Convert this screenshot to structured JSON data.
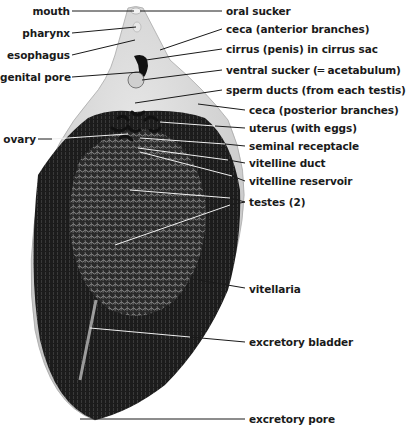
{
  "figure": {
    "colors": {
      "background": "#ffffff",
      "body_light": "#d4d4d4",
      "body_mid": "#8a8a8a",
      "vitellaria_dark": "#1c1c1c",
      "testes": "#5a5a5a",
      "leader_lines": "#1a1a1a",
      "inner_leader_lines": "#f0f0f0"
    }
  },
  "labels": {
    "left": [
      {
        "text": "mouth",
        "x": 60,
        "y": 5
      },
      {
        "text": "pharynx",
        "x": 68,
        "y": 27
      },
      {
        "text": "esophagus",
        "x": 68,
        "y": 49
      },
      {
        "text": "genital pore",
        "x": 68,
        "y": 71
      },
      {
        "text": "ovary",
        "x": 36,
        "y": 133
      }
    ],
    "right": [
      {
        "text": "oral sucker",
        "x": 226,
        "y": 5
      },
      {
        "text": "ceca (anterior branches)",
        "x": 226,
        "y": 23
      },
      {
        "text": "cirrus (penis) in cirrus sac",
        "x": 226,
        "y": 43
      },
      {
        "text": "ventral sucker (═ acetabulum)",
        "x": 226,
        "y": 64
      },
      {
        "text": "sperm ducts (from each testis)",
        "x": 226,
        "y": 84
      },
      {
        "text": "ceca (posterior branches)",
        "x": 249,
        "y": 104
      },
      {
        "text": "uterus (with eggs)",
        "x": 249,
        "y": 122
      },
      {
        "text": "seminal receptacle",
        "x": 249,
        "y": 140
      },
      {
        "text": "vitelline duct",
        "x": 249,
        "y": 157
      },
      {
        "text": "vitelline reservoir",
        "x": 249,
        "y": 175
      },
      {
        "text": "testes (2)",
        "x": 249,
        "y": 196
      },
      {
        "text": "vitellaria",
        "x": 249,
        "y": 283
      },
      {
        "text": "excretory bladder",
        "x": 249,
        "y": 336
      },
      {
        "text": "excretory pore",
        "x": 249,
        "y": 413
      }
    ]
  }
}
